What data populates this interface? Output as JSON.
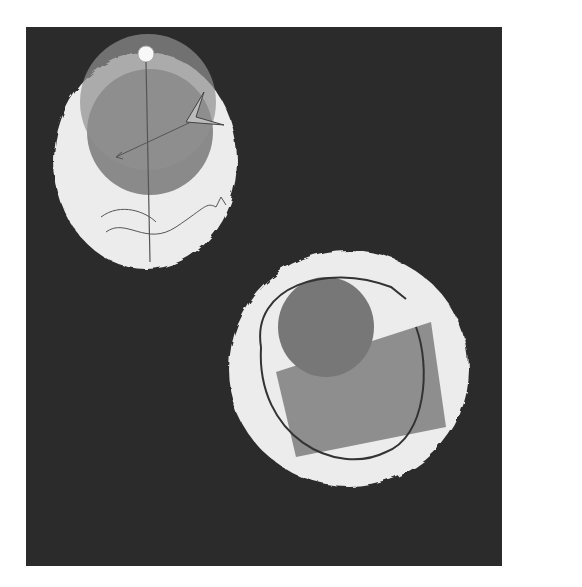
{
  "artwork": {
    "background_color": "#2b2b2b",
    "paper_color": "#ececec",
    "disc_color": "#8a8a8a",
    "shapes": [
      {
        "name": "upper-oval",
        "description": "white irregular oval with dark gray disc, small white ball on top, vertical line, arrow with dotted kite tail, curved lines and small bird"
      },
      {
        "name": "lower-oval",
        "description": "white irregular circle with overlapping gray rectangle and gray rounded shape, wire loop around, small star bursts"
      }
    ]
  }
}
